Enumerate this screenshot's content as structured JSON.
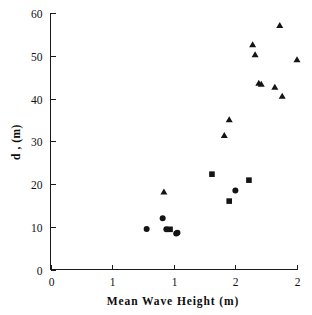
{
  "chart_data": {
    "type": "scatter",
    "title": "",
    "xlabel": "Mean Wave Height (m)",
    "ylabel": "d , (m)",
    "xlim": [
      0,
      2
    ],
    "ylim": [
      0,
      60
    ],
    "grid": false,
    "legend": "none",
    "xticks": [
      0,
      0.5,
      1,
      1.5,
      2
    ],
    "xticklabels": [
      "0",
      "1",
      "1",
      "2",
      "2"
    ],
    "yticks": [
      0,
      10,
      20,
      30,
      40,
      50,
      60
    ],
    "yticklabels": [
      "0",
      "10",
      "20",
      "30",
      "40",
      "50",
      "60"
    ],
    "series": [
      {
        "name": "circle-series",
        "marker": "circle",
        "color": "#141414",
        "points": [
          {
            "x": 0.78,
            "y": 9.5
          },
          {
            "x": 0.91,
            "y": 12.0
          },
          {
            "x": 0.94,
            "y": 9.4
          },
          {
            "x": 1.02,
            "y": 8.4
          },
          {
            "x": 1.03,
            "y": 8.6
          },
          {
            "x": 1.5,
            "y": 18.5
          }
        ]
      },
      {
        "name": "square-series",
        "marker": "square",
        "color": "#141414",
        "points": [
          {
            "x": 0.97,
            "y": 9.4
          },
          {
            "x": 1.31,
            "y": 22.3
          },
          {
            "x": 1.45,
            "y": 16.0
          },
          {
            "x": 1.61,
            "y": 20.9
          }
        ]
      },
      {
        "name": "triangle-series",
        "marker": "triangle",
        "color": "#141414",
        "points": [
          {
            "x": 0.92,
            "y": 18.1
          },
          {
            "x": 1.41,
            "y": 31.3
          },
          {
            "x": 1.45,
            "y": 35.0
          },
          {
            "x": 1.64,
            "y": 52.5
          },
          {
            "x": 1.66,
            "y": 50.2
          },
          {
            "x": 1.69,
            "y": 43.5
          },
          {
            "x": 1.71,
            "y": 43.3
          },
          {
            "x": 1.82,
            "y": 42.6
          },
          {
            "x": 1.86,
            "y": 57.0
          },
          {
            "x": 1.88,
            "y": 40.5
          },
          {
            "x": 2.0,
            "y": 49.0
          }
        ]
      }
    ]
  },
  "axes": {
    "x_title": "Mean Wave Height (m)",
    "y_title": "d , (m)",
    "x_labels": [
      "0",
      "1",
      "1",
      "2",
      "2"
    ],
    "y_labels": [
      "0",
      "10",
      "20",
      "30",
      "40",
      "50",
      "60"
    ]
  }
}
